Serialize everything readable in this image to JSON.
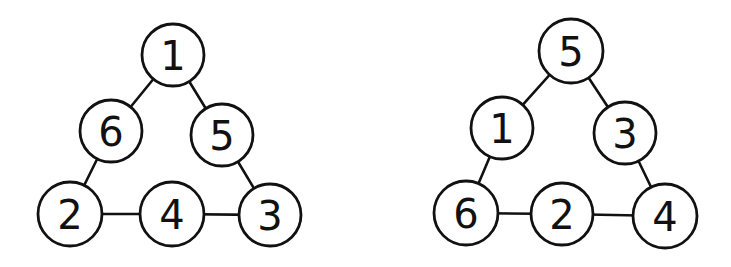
{
  "colors": {
    "stroke": "#111111",
    "background": "#ffffff",
    "node_fill": "#ffffff"
  },
  "triangles": [
    {
      "name": "left-triangle",
      "nodes": [
        {
          "id": "top",
          "label": "1",
          "cx": 173,
          "cy": 55,
          "r": 31
        },
        {
          "id": "left-mid",
          "label": "6",
          "cx": 111,
          "cy": 131,
          "r": 31
        },
        {
          "id": "right-mid",
          "label": "5",
          "cx": 222,
          "cy": 135,
          "r": 31
        },
        {
          "id": "bottom-left",
          "label": "2",
          "cx": 70,
          "cy": 214,
          "r": 32
        },
        {
          "id": "bottom-mid",
          "label": "4",
          "cx": 172,
          "cy": 214,
          "r": 32
        },
        {
          "id": "bottom-right",
          "label": "3",
          "cx": 270,
          "cy": 215,
          "r": 31
        }
      ],
      "edges": [
        [
          "top",
          "left-mid"
        ],
        [
          "top",
          "right-mid"
        ],
        [
          "left-mid",
          "bottom-left"
        ],
        [
          "right-mid",
          "bottom-right"
        ],
        [
          "bottom-left",
          "bottom-mid"
        ],
        [
          "bottom-mid",
          "bottom-right"
        ]
      ]
    },
    {
      "name": "right-triangle",
      "nodes": [
        {
          "id": "top",
          "label": "5",
          "cx": 571,
          "cy": 51,
          "r": 32
        },
        {
          "id": "left-mid",
          "label": "1",
          "cx": 502,
          "cy": 128,
          "r": 31
        },
        {
          "id": "right-mid",
          "label": "3",
          "cx": 625,
          "cy": 133,
          "r": 31
        },
        {
          "id": "bottom-left",
          "label": "6",
          "cx": 466,
          "cy": 213,
          "r": 32
        },
        {
          "id": "bottom-mid",
          "label": "2",
          "cx": 562,
          "cy": 214,
          "r": 31
        },
        {
          "id": "bottom-right",
          "label": "4",
          "cx": 665,
          "cy": 216,
          "r": 32
        }
      ],
      "edges": [
        [
          "top",
          "left-mid"
        ],
        [
          "top",
          "right-mid"
        ],
        [
          "left-mid",
          "bottom-left"
        ],
        [
          "right-mid",
          "bottom-right"
        ],
        [
          "bottom-left",
          "bottom-mid"
        ],
        [
          "bottom-mid",
          "bottom-right"
        ]
      ]
    }
  ]
}
